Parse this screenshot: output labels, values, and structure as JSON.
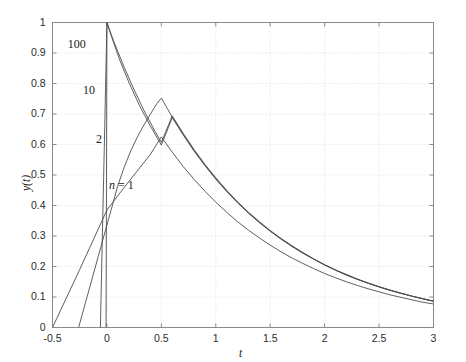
{
  "chart_data": {
    "type": "line",
    "title": "",
    "xlabel": "t",
    "ylabel": "y(t)",
    "xlim": [
      -0.5,
      3
    ],
    "ylim": [
      0,
      1
    ],
    "grid": true,
    "legend_position": "inline-annotations",
    "xticks": [
      "-0.5",
      "0",
      "0.5",
      "1",
      "1.5",
      "2",
      "2.5",
      "3"
    ],
    "xtick_values": [
      -0.5,
      0,
      0.5,
      1,
      1.5,
      2,
      2.5,
      3
    ],
    "yticks": [
      "0",
      "0.1",
      "0.2",
      "0.3",
      "0.4",
      "0.5",
      "0.6",
      "0.7",
      "0.8",
      "0.9",
      "1"
    ],
    "ytick_values": [
      0,
      0.1,
      0.2,
      0.3,
      0.4,
      0.5,
      0.6,
      0.7,
      0.8,
      0.9,
      1
    ],
    "line_color": "#4d4d4d",
    "grid_color": "#d8d8d8",
    "axis_color": "#8a8a8a",
    "annotations": [
      {
        "text": "100",
        "x": -0.36,
        "y": 0.925
      },
      {
        "text": "10",
        "x": -0.22,
        "y": 0.775
      },
      {
        "text": "2",
        "x": -0.1,
        "y": 0.615
      },
      {
        "text": "n = 1",
        "x": 0.02,
        "y": 0.465,
        "italic_prefix": "n"
      }
    ],
    "series": [
      {
        "name": "n = 1",
        "label": "n = 1",
        "x": [
          -0.5,
          -0.25,
          0.0,
          0.1,
          0.2,
          0.3,
          0.4,
          0.5,
          0.6,
          0.7,
          0.8,
          0.9,
          1.0,
          1.1,
          1.2,
          1.3,
          1.4,
          1.5,
          1.6,
          1.7,
          1.8,
          1.9,
          2.0,
          2.1,
          2.2,
          2.3,
          2.4,
          2.5,
          2.6,
          2.7,
          2.8,
          2.9,
          3.0
        ],
        "y": [
          0.0,
          0.19,
          0.385,
          0.432,
          0.478,
          0.523,
          0.568,
          0.625,
          0.575,
          0.528,
          0.486,
          0.447,
          0.411,
          0.378,
          0.347,
          0.319,
          0.294,
          0.27,
          0.248,
          0.228,
          0.21,
          0.193,
          0.177,
          0.163,
          0.15,
          0.138,
          0.127,
          0.117,
          0.107,
          0.099,
          0.091,
          0.083,
          0.077
        ]
      },
      {
        "name": "2",
        "label": "2",
        "x": [
          -0.26,
          -0.2,
          -0.14,
          -0.08,
          -0.02,
          0.04,
          0.1,
          0.16,
          0.22,
          0.28,
          0.34,
          0.4,
          0.46,
          0.5,
          0.6,
          0.7,
          0.8,
          0.9,
          1.0,
          1.1,
          1.2,
          1.3,
          1.4,
          1.5,
          1.6,
          1.7,
          1.8,
          1.9,
          2.0,
          2.1,
          2.2,
          2.3,
          2.4,
          2.5,
          2.6,
          2.7,
          2.8,
          2.9,
          3.0
        ],
        "y": [
          0.0,
          0.078,
          0.155,
          0.233,
          0.31,
          0.387,
          0.465,
          0.527,
          0.58,
          0.625,
          0.664,
          0.7,
          0.735,
          0.752,
          0.69,
          0.633,
          0.58,
          0.532,
          0.487,
          0.447,
          0.41,
          0.376,
          0.345,
          0.316,
          0.29,
          0.266,
          0.244,
          0.224,
          0.205,
          0.188,
          0.172,
          0.158,
          0.145,
          0.133,
          0.122,
          0.112,
          0.103,
          0.094,
          0.086
        ]
      },
      {
        "name": "10",
        "label": "10",
        "x": [
          -0.06,
          -0.05,
          -0.04,
          -0.03,
          -0.02,
          -0.01,
          0.0,
          0.02,
          0.06,
          0.12,
          0.2,
          0.3,
          0.4,
          0.5,
          0.6,
          0.7,
          0.8,
          0.9,
          1.0,
          1.1,
          1.2,
          1.3,
          1.4,
          1.5,
          1.6,
          1.7,
          1.8,
          1.9,
          2.0,
          2.1,
          2.2,
          2.3,
          2.4,
          2.5,
          2.6,
          2.7,
          2.8,
          2.9,
          3.0
        ],
        "y": [
          0.0,
          0.165,
          0.33,
          0.495,
          0.66,
          0.83,
          1.0,
          0.978,
          0.935,
          0.875,
          0.805,
          0.727,
          0.66,
          0.598,
          0.688,
          0.632,
          0.579,
          0.531,
          0.487,
          0.446,
          0.409,
          0.375,
          0.344,
          0.316,
          0.29,
          0.266,
          0.244,
          0.224,
          0.205,
          0.188,
          0.172,
          0.158,
          0.145,
          0.133,
          0.122,
          0.112,
          0.103,
          0.094,
          0.086
        ]
      },
      {
        "name": "100",
        "label": "100",
        "x": [
          -0.008,
          -0.006,
          -0.004,
          -0.002,
          0.0,
          0.01,
          0.03,
          0.06,
          0.1,
          0.16,
          0.24,
          0.34,
          0.44,
          0.5,
          0.6,
          0.7,
          0.8,
          0.9,
          1.0,
          1.1,
          1.2,
          1.3,
          1.4,
          1.5,
          1.6,
          1.7,
          1.8,
          1.9,
          2.0,
          2.1,
          2.2,
          2.3,
          2.4,
          2.5,
          2.6,
          2.7,
          2.8,
          2.9,
          3.0
        ],
        "y": [
          0.0,
          0.25,
          0.5,
          0.75,
          1.0,
          0.99,
          0.97,
          0.941,
          0.905,
          0.852,
          0.787,
          0.712,
          0.644,
          0.607,
          0.694,
          0.637,
          0.584,
          0.535,
          0.491,
          0.45,
          0.412,
          0.378,
          0.347,
          0.318,
          0.292,
          0.268,
          0.246,
          0.225,
          0.206,
          0.189,
          0.174,
          0.159,
          0.146,
          0.134,
          0.123,
          0.113,
          0.103,
          0.095,
          0.087
        ]
      }
    ]
  }
}
